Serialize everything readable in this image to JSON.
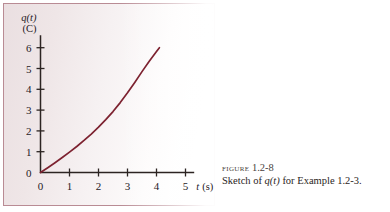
{
  "figure": {
    "caption_label": "FIGURE",
    "caption_number": "1.2-8",
    "caption_text_prefix": "Sketch of ",
    "caption_text_var": "q(t)",
    "caption_text_suffix": " for Example 1.2-3.",
    "frame_border_color": "#b98b94",
    "curve_color": "#7d2230",
    "axis_color": "#2c2422"
  },
  "chart_data": {
    "type": "line",
    "title": "",
    "xlabel": "t (s)",
    "ylabel": "q(t) (C)",
    "ylabel_symbol": "q(t)",
    "ylabel_unit": "(C)",
    "xlabel_symbol": "t",
    "xlabel_unit": "(s)",
    "xlim": [
      0,
      5.3
    ],
    "ylim": [
      0,
      6.6
    ],
    "xticks": [
      0,
      1,
      2,
      3,
      4,
      5
    ],
    "yticks": [
      0,
      1,
      2,
      3,
      4,
      5,
      6
    ],
    "xticklabels": [
      "0",
      "1",
      "2",
      "3",
      "4",
      "5"
    ],
    "yticklabels": [
      "0",
      "1",
      "2",
      "3",
      "4",
      "5",
      "6"
    ],
    "grid": false,
    "legend": "none",
    "series": [
      {
        "name": "q(t)",
        "color": "#7d2230",
        "x": [
          0.0,
          0.25,
          0.5,
          0.75,
          1.0,
          1.25,
          1.5,
          1.75,
          2.0,
          2.25,
          2.5,
          2.75,
          3.0,
          3.25,
          3.5,
          3.75,
          4.0,
          4.1
        ],
        "y": [
          0.0,
          0.23,
          0.47,
          0.72,
          0.98,
          1.25,
          1.54,
          1.85,
          2.18,
          2.54,
          2.93,
          3.36,
          3.83,
          4.33,
          4.85,
          5.35,
          5.82,
          6.0
        ]
      }
    ]
  }
}
